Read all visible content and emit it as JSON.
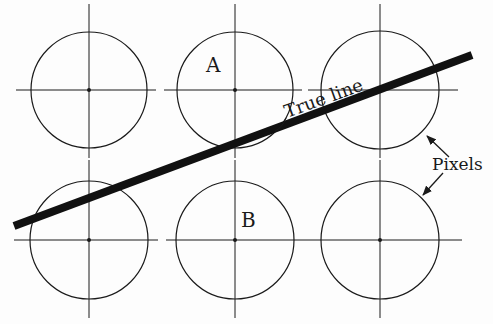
{
  "diagram": {
    "labels": {
      "a": "A",
      "b": "B",
      "true_line": "True line",
      "pixels": "Pixels"
    },
    "pixel_centers": [
      {
        "x": 89,
        "y": 90
      },
      {
        "x": 235,
        "y": 90
      },
      {
        "x": 380,
        "y": 90
      },
      {
        "x": 89,
        "y": 240
      },
      {
        "x": 235,
        "y": 240
      },
      {
        "x": 380,
        "y": 240
      }
    ],
    "pixel_radius": 58,
    "true_line": {
      "x1": 14,
      "y1": 226,
      "x2": 472,
      "y2": 55
    },
    "colors": {
      "ink": "#1a1a1a",
      "background": "#fdfdfd"
    }
  }
}
